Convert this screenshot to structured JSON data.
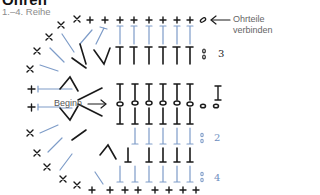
{
  "header": {
    "title": "Ohren",
    "subtitle": "1.–4. Reihe"
  },
  "annotations": {
    "start_label": "Beginn",
    "join_label_line1": "Ohrteile",
    "join_label_line2": "verbinden"
  },
  "row_labels": [
    {
      "row": "3",
      "color": "#222222"
    },
    {
      "row": "1",
      "color": "#222222"
    },
    {
      "row": "2",
      "color": "#6f8fbf"
    },
    {
      "row": "4",
      "color": "#6f8fbf"
    }
  ],
  "colors": {
    "dark_stitch": "#1a1a1a",
    "light_stitch": "#7e9cc8",
    "text_gray": "#666666"
  },
  "legend_symbols": {
    "sc": "+",
    "hdc": "T",
    "ch": "o"
  }
}
